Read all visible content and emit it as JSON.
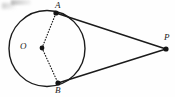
{
  "figure": {
    "kind": "geometry-diagram",
    "background_color": "#fefefe",
    "stroke_color": "#1b1b1b",
    "canvas": {
      "width": 175,
      "height": 97
    },
    "circle": {
      "name": "circle-O",
      "center_label": "O",
      "center_x": 47,
      "center_y": 48.5,
      "radius": 38,
      "stroke_width": 1.4,
      "style": "solid"
    },
    "points": [
      {
        "id": "A",
        "label": "A",
        "x": 56,
        "y": 13,
        "dot_radius": 2.6,
        "label_x": 55,
        "label_y": 1
      },
      {
        "id": "B",
        "label": "B",
        "x": 58,
        "y": 83,
        "dot_radius": 2.6,
        "label_x": 55,
        "label_y": 86
      },
      {
        "id": "O",
        "label": "O",
        "x": 42,
        "y": 48,
        "dot_radius": 2.4,
        "label_x": 20,
        "label_y": 42
      },
      {
        "id": "P",
        "label": "P",
        "x": 166,
        "y": 49,
        "dot_radius": 2.6,
        "label_x": 164,
        "label_y": 33
      }
    ],
    "segments": [
      {
        "id": "AP",
        "from": "A",
        "to": "P",
        "style": "solid",
        "stroke_width": 1.5,
        "meaning": "tangent-segment"
      },
      {
        "id": "BP",
        "from": "B",
        "to": "P",
        "style": "solid",
        "stroke_width": 1.5,
        "meaning": "tangent-segment"
      },
      {
        "id": "OA",
        "from": "O",
        "to": "A",
        "style": "dotted",
        "stroke_width": 1.2,
        "meaning": "radius"
      },
      {
        "id": "OB",
        "from": "O",
        "to": "B",
        "style": "dotted",
        "stroke_width": 1.2,
        "meaning": "radius"
      }
    ],
    "labels": {
      "A": "A",
      "B": "B",
      "O": "O",
      "P": "P"
    }
  }
}
